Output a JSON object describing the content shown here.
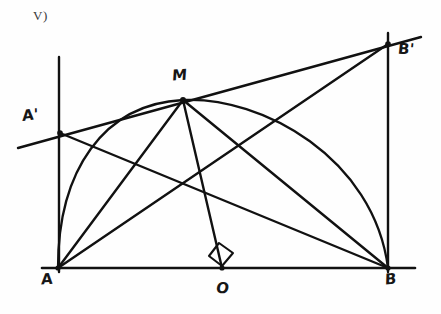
{
  "figure": {
    "item_marker": "V)",
    "ink_color": "#111111",
    "paper_color": "#fefefe",
    "labels": [
      {
        "id": "A-prime",
        "text": "A'",
        "x": 22,
        "y": 108
      },
      {
        "id": "M",
        "text": "M",
        "x": 172,
        "y": 68
      },
      {
        "id": "B-prime",
        "text": "B'",
        "x": 398,
        "y": 42
      },
      {
        "id": "A",
        "text": "A",
        "x": 41,
        "y": 272
      },
      {
        "id": "O",
        "text": "O",
        "x": 216,
        "y": 281
      },
      {
        "id": "B",
        "text": "B",
        "x": 385,
        "y": 272
      }
    ],
    "points": {
      "A": {
        "x": 58,
        "y": 268
      },
      "O": {
        "x": 222,
        "y": 268
      },
      "B": {
        "x": 388,
        "y": 268
      },
      "M": {
        "x": 183,
        "y": 100
      },
      "A_prime": {
        "x": 60,
        "y": 133
      },
      "B_prime": {
        "x": 388,
        "y": 44
      }
    },
    "segments": [
      {
        "id": "baseline",
        "x1": 42,
        "y1": 268,
        "x2": 415,
        "y2": 268
      },
      {
        "id": "vertical-at-A",
        "x1": 59,
        "y1": 57,
        "x2": 59,
        "y2": 272
      },
      {
        "id": "vertical-at-B",
        "x1": 388,
        "y1": 33,
        "x2": 388,
        "y2": 272
      },
      {
        "id": "tangent-line",
        "x1": 18,
        "y1": 148,
        "x2": 421,
        "y2": 37
      },
      {
        "id": "M-to-A",
        "x1": 183,
        "y1": 100,
        "x2": 58,
        "y2": 268
      },
      {
        "id": "M-to-O",
        "x1": 183,
        "y1": 100,
        "x2": 222,
        "y2": 268
      },
      {
        "id": "M-to-B",
        "x1": 183,
        "y1": 100,
        "x2": 388,
        "y2": 268
      },
      {
        "id": "A-prime-to-B",
        "x1": 60,
        "y1": 133,
        "x2": 388,
        "y2": 268
      },
      {
        "id": "A-to-B-prime",
        "x1": 58,
        "y1": 268,
        "x2": 388,
        "y2": 44
      }
    ],
    "arc": {
      "id": "semicircle-AMB",
      "center_x": 222,
      "center_y": 268,
      "radius": 165,
      "path": "M 58 268 C 58 170, 104 104, 183 100 C 262 96, 374 158, 388 268"
    },
    "right_angle_marker": {
      "id": "right-angle-at-O",
      "vertex_x": 222,
      "vertex_y": 268,
      "path": "M 209 256 L 219 243 L 233 253 L 222 266 Z"
    }
  }
}
